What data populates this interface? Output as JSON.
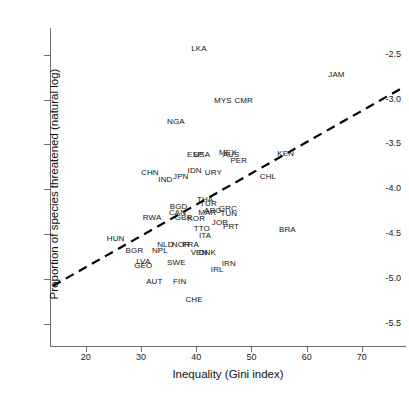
{
  "chart_data": {
    "type": "scatter",
    "title": "",
    "xlabel": "Inequality (Gini index)",
    "ylabel": "Proportion of species threatened (natural log)",
    "xlim": [
      13.5,
      78
    ],
    "ylim": [
      -5.75,
      -2.2
    ],
    "xticks": [
      20,
      30,
      40,
      50,
      60,
      70
    ],
    "yticks": [
      -2.5,
      -3.0,
      -3.5,
      -4.0,
      -4.5,
      -5.0,
      -5.5
    ],
    "ytick_labels": [
      "-2.5",
      "-3.0",
      "-3.5",
      "-4.0",
      "-4.5",
      "-5.0",
      "-5.5"
    ],
    "xtick_labels": [
      "20",
      "30",
      "40",
      "50",
      "60",
      "70"
    ],
    "grid": false,
    "legend": "none",
    "marker_style": "text-label",
    "label_field": "country",
    "trend_line": {
      "type": "linear-fit",
      "style": "dashed",
      "color": "#000000",
      "width": 2.2,
      "x_start": 14.0,
      "y_start": -5.08,
      "x_end": 77.0,
      "y_end": -2.88
    },
    "points": [
      {
        "country": "LKA",
        "x": 40.5,
        "y": -2.43
      },
      {
        "country": "JAM",
        "x": 65.4,
        "y": -2.73
      },
      {
        "country": "MYS",
        "x": 44.8,
        "y": -3.02
      },
      {
        "country": "CMR",
        "x": 48.6,
        "y": -3.02
      },
      {
        "country": "NGA",
        "x": 36.3,
        "y": -3.25
      },
      {
        "country": "ESP",
        "x": 39.8,
        "y": -3.62
      },
      {
        "country": "USA",
        "x": 41.0,
        "y": -3.62
      },
      {
        "country": "MEX",
        "x": 45.7,
        "y": -3.6
      },
      {
        "country": "AUS",
        "x": 46.3,
        "y": -3.62
      },
      {
        "country": "PER",
        "x": 47.7,
        "y": -3.68
      },
      {
        "country": "KEN",
        "x": 56.2,
        "y": -3.61
      },
      {
        "country": "CHN",
        "x": 31.6,
        "y": -3.82
      },
      {
        "country": "IDN",
        "x": 39.7,
        "y": -3.8
      },
      {
        "country": "URY",
        "x": 43.1,
        "y": -3.82
      },
      {
        "country": "JPN",
        "x": 37.2,
        "y": -3.86
      },
      {
        "country": "IND",
        "x": 34.4,
        "y": -3.9
      },
      {
        "country": "CHL",
        "x": 53.0,
        "y": -3.86
      },
      {
        "country": "BGD",
        "x": 36.8,
        "y": -4.2
      },
      {
        "country": "THA",
        "x": 41.6,
        "y": -4.12
      },
      {
        "country": "TUR",
        "x": 42.2,
        "y": -4.16
      },
      {
        "country": "CAN",
        "x": 36.6,
        "y": -4.26
      },
      {
        "country": "ARG",
        "x": 43.0,
        "y": -4.24
      },
      {
        "country": "GRC",
        "x": 45.7,
        "y": -4.22
      },
      {
        "country": "MAR",
        "x": 42.0,
        "y": -4.26
      },
      {
        "country": "TUN",
        "x": 45.9,
        "y": -4.28
      },
      {
        "country": "GBR",
        "x": 37.7,
        "y": -4.32
      },
      {
        "country": "KOR",
        "x": 40.0,
        "y": -4.33
      },
      {
        "country": "RWA",
        "x": 32.0,
        "y": -4.32
      },
      {
        "country": "JOR",
        "x": 44.3,
        "y": -4.38
      },
      {
        "country": "PRT",
        "x": 46.3,
        "y": -4.42
      },
      {
        "country": "TTO",
        "x": 41.0,
        "y": -4.44
      },
      {
        "country": "ITA",
        "x": 41.6,
        "y": -4.52
      },
      {
        "country": "BRA",
        "x": 56.5,
        "y": -4.46
      },
      {
        "country": "HUN",
        "x": 25.4,
        "y": -4.56
      },
      {
        "country": "NLD",
        "x": 34.4,
        "y": -4.62
      },
      {
        "country": "NOR",
        "x": 37.2,
        "y": -4.62
      },
      {
        "country": "FRA",
        "x": 39.0,
        "y": -4.62
      },
      {
        "country": "BGR",
        "x": 28.8,
        "y": -4.69
      },
      {
        "country": "NPL",
        "x": 33.4,
        "y": -4.69
      },
      {
        "country": "VEN",
        "x": 40.5,
        "y": -4.71
      },
      {
        "country": "DNK",
        "x": 42.0,
        "y": -4.71
      },
      {
        "country": "LVA",
        "x": 30.4,
        "y": -4.81
      },
      {
        "country": "GEO",
        "x": 30.4,
        "y": -4.86
      },
      {
        "country": "SWE",
        "x": 36.4,
        "y": -4.82
      },
      {
        "country": "IRN",
        "x": 45.9,
        "y": -4.84
      },
      {
        "country": "IRL",
        "x": 43.8,
        "y": -4.9
      },
      {
        "country": "AUT",
        "x": 32.4,
        "y": -5.03
      },
      {
        "country": "FIN",
        "x": 37.0,
        "y": -5.03
      },
      {
        "country": "CHE",
        "x": 39.6,
        "y": -5.24
      }
    ]
  }
}
